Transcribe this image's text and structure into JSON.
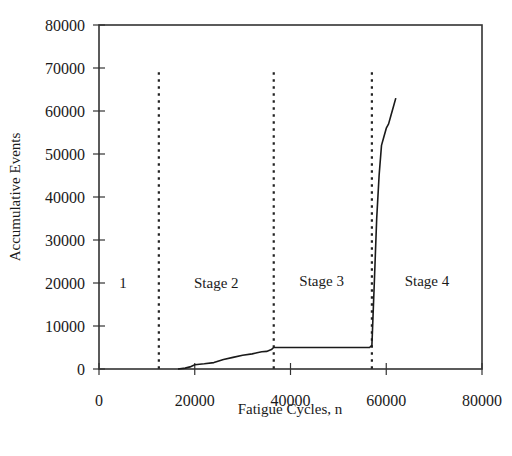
{
  "chart_data": {
    "type": "line",
    "title": "",
    "xlabel": "Fatigue Cycles, n",
    "ylabel": "Accumulative Events",
    "xlim": [
      0,
      80000
    ],
    "ylim": [
      0,
      80000
    ],
    "xticks": [
      0,
      20000,
      40000,
      60000,
      80000
    ],
    "yticks": [
      0,
      10000,
      20000,
      30000,
      40000,
      50000,
      60000,
      70000,
      80000
    ],
    "xtick_labels": [
      "0",
      "20000",
      "40000",
      "60000",
      "80000"
    ],
    "ytick_labels": [
      "0",
      "10000",
      "20000",
      "30000",
      "40000",
      "50000",
      "60000",
      "70000",
      "80000"
    ],
    "grid": false,
    "series": [
      {
        "name": "Accumulative Events",
        "x": [
          16500,
          18000,
          19000,
          20000,
          22000,
          24000,
          26000,
          28000,
          30000,
          32000,
          33000,
          34000,
          35000,
          36000,
          36500,
          37000,
          40000,
          45000,
          50000,
          55000,
          56500,
          57000,
          57500,
          58000,
          58500,
          59000,
          59500,
          60000,
          60500,
          61000,
          61500,
          62000
        ],
        "y": [
          0,
          200,
          500,
          1000,
          1200,
          1500,
          2200,
          2700,
          3200,
          3500,
          3800,
          4000,
          4100,
          4500,
          5000,
          5000,
          5000,
          5000,
          5000,
          5000,
          5000,
          5500,
          20000,
          35000,
          45000,
          52000,
          54000,
          56000,
          57000,
          59000,
          61000,
          63000
        ]
      }
    ],
    "stage_boundaries": [
      {
        "x": 12500,
        "y_top": 69000
      },
      {
        "x": 36500,
        "y_top": 69000
      },
      {
        "x": 57000,
        "y_top": 69000
      }
    ],
    "annotations": [
      {
        "text": "1",
        "x": 5000,
        "y": 20000
      },
      {
        "text": "Stage 2",
        "x": 24500,
        "y": 20000
      },
      {
        "text": "Stage 3",
        "x": 46500,
        "y": 20500
      },
      {
        "text": "Stage 4",
        "x": 68500,
        "y": 20500
      }
    ],
    "colors": {
      "line": "#1a1a1a",
      "axis": "#333333"
    }
  }
}
